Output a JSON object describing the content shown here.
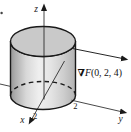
{
  "figure": {
    "kind": "3d-cylinder-gradient-diagram",
    "background": "#ffffff",
    "outline_color": "#1a1a1a",
    "cylinder": {
      "top_fill": "#c9c9c9",
      "body_fill_light": "#efefef",
      "body_fill_dark": "#999999"
    },
    "labels": {
      "z_axis": "z",
      "y_axis": "y",
      "x_axis": "x",
      "x_tick": "2",
      "y_tick": "2"
    },
    "gradient_vector": {
      "nabla": "∇",
      "function": "F",
      "point": "(0, 2, 4)"
    }
  }
}
